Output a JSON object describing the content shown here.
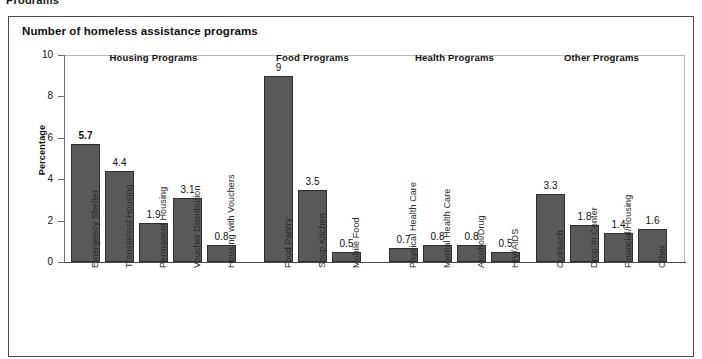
{
  "top_cropped_text": "Programs",
  "panel": {
    "title": "Number of homeless assistance programs"
  },
  "chart_data": {
    "type": "bar",
    "title": "Number of homeless assistance programs",
    "xlabel": "",
    "ylabel": "Percentage",
    "ylim": [
      0,
      10
    ],
    "yticks": [
      "0",
      "2",
      "4",
      "6",
      "8",
      "10"
    ],
    "grid": false,
    "legend": "none",
    "bar_color": "#595959",
    "bar_border_color": "#2e2e2e",
    "groups": [
      {
        "name": "Housing Programs",
        "categories": [
          "Emergency Shelter",
          "Transitional Housing",
          "Permanent Housing",
          "Voucher Distribution",
          "Housing with Vouchers"
        ],
        "values": [
          5.7,
          4.4,
          1.9,
          3.1,
          0.8
        ],
        "labels": [
          "5.7",
          "4.4",
          "1.9",
          "3.1",
          "0.8"
        ],
        "emphasis": [
          true,
          false,
          false,
          false,
          false
        ]
      },
      {
        "name": "Food Programs",
        "categories": [
          "Food Pantry",
          "Soup Kitchen",
          "Mobile Food"
        ],
        "values": [
          9,
          3.5,
          0.5
        ],
        "labels": [
          "9",
          "3.5",
          "0.5"
        ],
        "emphasis": [
          false,
          false,
          false
        ]
      },
      {
        "name": "Health Programs",
        "categories": [
          "Physical Health Care",
          "Mental Health Care",
          "Alcohol/Drug",
          "HIV/AIDS"
        ],
        "values": [
          0.7,
          0.8,
          0.8,
          0.5
        ],
        "labels": [
          "0.7",
          "0.8",
          "0.8",
          "0.5"
        ],
        "emphasis": [
          false,
          false,
          false,
          false
        ]
      },
      {
        "name": "Other Programs",
        "categories": [
          "Outreach",
          "Drop-In Center",
          "Financial/Housing",
          "Other"
        ],
        "values": [
          3.3,
          1.8,
          1.4,
          1.6
        ],
        "labels": [
          "3.3",
          "1.8",
          "1.4",
          "1.6"
        ],
        "emphasis": [
          false,
          false,
          false,
          false
        ]
      }
    ]
  }
}
